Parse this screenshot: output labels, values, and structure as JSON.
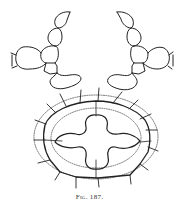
{
  "figure": {
    "caption": "Fig. 187.",
    "ink_color": "#222222",
    "paper_color": "#ffffff",
    "panels": [
      {
        "name": "upper-left-cell-chain",
        "description": "branched chain of cells, left"
      },
      {
        "name": "upper-right-cell-chain",
        "description": "branched chain of cells, mirrored right"
      },
      {
        "name": "cross-section",
        "description": "oval section with cruciform center and radiating hairs"
      }
    ]
  }
}
